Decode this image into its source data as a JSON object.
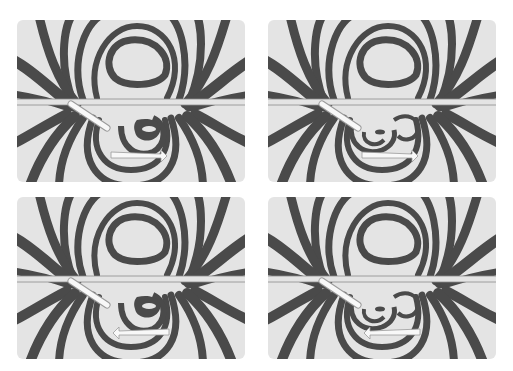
{
  "figure": {
    "layout": "2x2 grid",
    "background": "#ffffff",
    "panel_background": "#e4e4e4",
    "band_color": "#4a4a4a",
    "panels": [
      {
        "id": "top-left",
        "arrow_direction": "right",
        "tip_variant": "single-loop"
      },
      {
        "id": "top-right",
        "arrow_direction": "right",
        "tip_variant": "double-loop"
      },
      {
        "id": "bottom-left",
        "arrow_direction": "left",
        "tip_variant": "single-loop"
      },
      {
        "id": "bottom-right",
        "arrow_direction": "left",
        "tip_variant": "double-loop"
      }
    ]
  }
}
